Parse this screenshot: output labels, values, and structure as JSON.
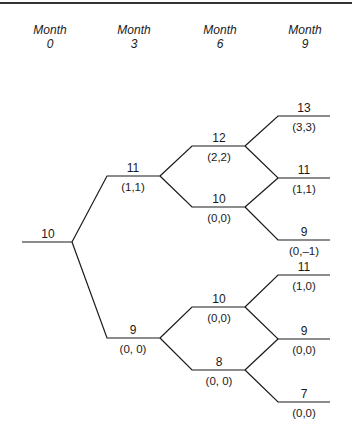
{
  "headers": [
    {
      "line1": "Month",
      "line2": "0"
    },
    {
      "line1": "Month",
      "line2": "3"
    },
    {
      "line1": "Month",
      "line2": "6"
    },
    {
      "line1": "Month",
      "line2": "9"
    }
  ],
  "nodes": {
    "root": {
      "value": "10"
    },
    "m3_up": {
      "value": "11",
      "payoff": "(1,1)"
    },
    "m3_down": {
      "value": "9",
      "payoff": "(0, 0)"
    },
    "m6_uu": {
      "value": "12",
      "payoff": "(2,2)"
    },
    "m6_ud": {
      "value": "10",
      "payoff": "(0,0)"
    },
    "m6_du": {
      "value": "10",
      "payoff": "(0,0)"
    },
    "m6_dd": {
      "value": "8",
      "payoff": "(0, 0)"
    },
    "m9_1": {
      "value": "13",
      "payoff": "(3,3)"
    },
    "m9_2": {
      "value": "11",
      "payoff": "(1,1)"
    },
    "m9_3": {
      "value": "9",
      "payoff": "(0,–1)"
    },
    "m9_4": {
      "value": "11",
      "payoff": "(1,0)"
    },
    "m9_5": {
      "value": "9",
      "payoff": "(0,0)"
    },
    "m9_6": {
      "value": "7",
      "payoff": "(0,0)"
    }
  }
}
